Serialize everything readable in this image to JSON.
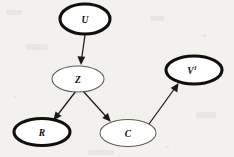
{
  "figure": {
    "kind": "directed-acyclic-graph",
    "caption": "",
    "background_color": "#f2f1ee",
    "ink_color": "#100f0d",
    "thin_stroke_color": "#5d5c59"
  },
  "nodes": [
    {
      "id": "U",
      "label": "U",
      "superscript": "",
      "cx": 85,
      "cy": 19,
      "rx": 25,
      "ry": 15,
      "emphasis": "thick"
    },
    {
      "id": "Z",
      "label": "Z",
      "superscript": "",
      "cx": 78,
      "cy": 79,
      "rx": 26,
      "ry": 13,
      "emphasis": "thin"
    },
    {
      "id": "V1",
      "label": "V",
      "superscript": "1",
      "cx": 194,
      "cy": 70,
      "rx": 28,
      "ry": 14,
      "emphasis": "thick"
    },
    {
      "id": "R",
      "label": "R",
      "superscript": "",
      "cx": 42,
      "cy": 132,
      "rx": 28,
      "ry": 13.5,
      "emphasis": "thick"
    },
    {
      "id": "C",
      "label": "C",
      "superscript": "",
      "cx": 128,
      "cy": 133,
      "rx": 28,
      "ry": 13.5,
      "emphasis": "thin"
    }
  ],
  "edges": [
    {
      "id": "U-Z",
      "from": "U",
      "to": "Z",
      "x1": 85,
      "y1": 35,
      "x2": 81,
      "y2": 64,
      "arrowhead": "filled-triangle"
    },
    {
      "id": "Z-R",
      "from": "Z",
      "to": "R",
      "x1": 75,
      "y1": 92,
      "x2": 54,
      "y2": 119,
      "arrowhead": "filled-triangle"
    },
    {
      "id": "Z-C",
      "from": "Z",
      "to": "C",
      "x1": 84,
      "y1": 92,
      "x2": 110,
      "y2": 121,
      "arrowhead": "filled-triangle"
    },
    {
      "id": "C-V1",
      "from": "C",
      "to": "V1",
      "x1": 150,
      "y1": 124,
      "x2": 178,
      "y2": 84,
      "arrowhead": "filled-triangle"
    }
  ]
}
